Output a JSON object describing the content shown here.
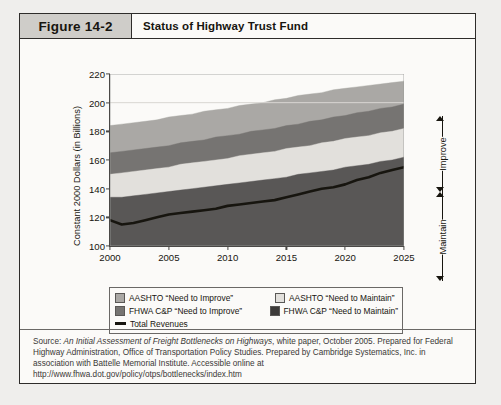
{
  "figure": {
    "number": "Figure 14-2",
    "title": "Status of Highway Trust Fund"
  },
  "chart_data": {
    "type": "area",
    "title": "Status of Highway Trust Fund",
    "xlabel": "",
    "ylabel": "Constant 2000 Dollars (in Billions)",
    "xlim": [
      2000,
      2025
    ],
    "ylim": [
      100,
      220
    ],
    "ytick_labels": [
      "100",
      "120",
      "140",
      "160",
      "180",
      "200",
      "220"
    ],
    "yticks": [
      100,
      120,
      140,
      160,
      180,
      200,
      220
    ],
    "xtick_labels": [
      "2000",
      "2005",
      "2010",
      "2015",
      "2020",
      "2025"
    ],
    "xticks": [
      2000,
      2005,
      2010,
      2015,
      2020,
      2025
    ],
    "grid": false,
    "legend_position": "below",
    "stacked": true,
    "x": [
      2000,
      2001,
      2002,
      2003,
      2004,
      2005,
      2006,
      2007,
      2008,
      2009,
      2010,
      2011,
      2012,
      2013,
      2014,
      2015,
      2016,
      2017,
      2018,
      2019,
      2020,
      2021,
      2022,
      2023,
      2024,
      2025
    ],
    "series": [
      {
        "name": "FHWA C&P “Need to Maintain”",
        "color": "#595756",
        "boundary_top": [
          134,
          134,
          135,
          136,
          137,
          138,
          139,
          140,
          141,
          142,
          143,
          144,
          145,
          146,
          147,
          148,
          150,
          151,
          152,
          153,
          155,
          156,
          157,
          159,
          160,
          162
        ]
      },
      {
        "name": "AASHTO “Need to Maintain”",
        "color": "#e2e0dc",
        "boundary_top": [
          150,
          151,
          152,
          153,
          154,
          155,
          157,
          158,
          159,
          160,
          161,
          163,
          164,
          165,
          166,
          168,
          169,
          170,
          172,
          173,
          175,
          176,
          177,
          179,
          180,
          182
        ]
      },
      {
        "name": "FHWA C&P “Need to Improve”",
        "color": "#767472",
        "boundary_top": [
          165,
          166,
          167,
          168,
          169,
          170,
          172,
          173,
          174,
          176,
          177,
          178,
          180,
          181,
          182,
          184,
          185,
          187,
          188,
          190,
          191,
          193,
          194,
          196,
          197,
          199
        ]
      },
      {
        "name": "AASHTO “Need to Improve”",
        "color": "#aaa8a5",
        "boundary_top": [
          184,
          185,
          186,
          187,
          188,
          190,
          191,
          192,
          194,
          195,
          196,
          198,
          199,
          200,
          202,
          203,
          205,
          206,
          207,
          209,
          210,
          211,
          212,
          213,
          214,
          215
        ]
      }
    ],
    "revenue_line": {
      "name": "Total Revenues",
      "color": "#17150f",
      "values": [
        118,
        115,
        116,
        118,
        120,
        122,
        123,
        124,
        125,
        126,
        128,
        129,
        130,
        131,
        132,
        134,
        136,
        138,
        140,
        141,
        143,
        146,
        148,
        151,
        153,
        155
      ]
    },
    "brackets": [
      {
        "label": "Improve",
        "from": 162,
        "to": 215
      },
      {
        "label": "Maintain",
        "from": 100,
        "to": 162
      }
    ]
  },
  "legend": {
    "items": [
      {
        "label": "AASHTO “Need to Improve”",
        "swatch": "#aaa8a5",
        "type": "swatch"
      },
      {
        "label": "AASHTO “Need to Maintain”",
        "swatch": "#e2e0dc",
        "type": "swatch"
      },
      {
        "label": "FHWA C&P “Need to Improve”",
        "swatch": "#767472",
        "type": "swatch"
      },
      {
        "label": "FHWA C&P “Need to Maintain”",
        "swatch": "#3d3b3a",
        "type": "swatch"
      },
      {
        "label": "Total Revenues",
        "swatch": "#17150f",
        "type": "line"
      }
    ]
  },
  "source": {
    "prefix": "Source: ",
    "italic_title": "An Initial Assessment of Freight Bottlenecks on Highways",
    "rest": ", white paper, October 2005. Prepared for Federal Highway Administration, Office of Transportation Policy Studies. Prepared by Cambridge Systematics, Inc. in association with Battelle Memorial Institute. Accessible online at http://www.fhwa.dot.gov/policy/otps/bottlenecks/index.htm"
  }
}
